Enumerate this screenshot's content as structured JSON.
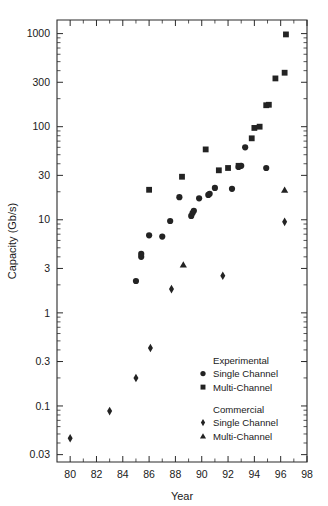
{
  "chart_data": {
    "type": "scatter",
    "title": "",
    "xlabel": "Year",
    "ylabel": "Capacity (Gb/s)",
    "xlim": [
      79,
      98
    ],
    "ylim": [
      0.025,
      1400
    ],
    "yscale": "log",
    "xscale": "linear",
    "grid": false,
    "xticks": [
      80,
      82,
      84,
      86,
      88,
      90,
      92,
      94,
      96,
      98
    ],
    "xtick_labels": [
      "80",
      "82",
      "84",
      "86",
      "88",
      "90",
      "92",
      "94",
      "96",
      "98"
    ],
    "yticks": [
      0.03,
      0.1,
      0.3,
      1,
      3,
      10,
      30,
      100,
      300,
      1000
    ],
    "ytick_labels": [
      "0.03",
      "0.1",
      "0.3",
      "1",
      "3",
      "10",
      "30",
      "100",
      "300",
      "1000"
    ],
    "legend_position": "lower-right",
    "legend_groups": [
      {
        "heading": "Experimental",
        "entries": [
          {
            "label": "Single Channel",
            "marker": "circle"
          },
          {
            "label": "Multi-Channel",
            "marker": "square"
          }
        ]
      },
      {
        "heading": "Commercial",
        "entries": [
          {
            "label": "Single Channel",
            "marker": "diamond"
          },
          {
            "label": "Multi-Channel",
            "marker": "triangle"
          }
        ]
      }
    ],
    "series": [
      {
        "name": "Experimental Single Channel",
        "marker": "circle",
        "color": "#232323",
        "points": [
          [
            85.0,
            2.2
          ],
          [
            85.4,
            4.0
          ],
          [
            85.4,
            4.3
          ],
          [
            86.0,
            6.8
          ],
          [
            87.0,
            6.6
          ],
          [
            87.6,
            9.7
          ],
          [
            88.3,
            17.5
          ],
          [
            89.2,
            11.0
          ],
          [
            89.3,
            11.8
          ],
          [
            89.4,
            12.5
          ],
          [
            89.8,
            17.0
          ],
          [
            90.5,
            18.5
          ],
          [
            90.6,
            19.0
          ],
          [
            91.0,
            22.0
          ],
          [
            92.3,
            21.5
          ],
          [
            92.8,
            37.0
          ],
          [
            93.0,
            38.0
          ],
          [
            93.3,
            60.0
          ],
          [
            94.9,
            36.0
          ]
        ]
      },
      {
        "name": "Experimental Multi-Channel",
        "marker": "square",
        "color": "#232323",
        "points": [
          [
            86.0,
            21.0
          ],
          [
            88.5,
            29.0
          ],
          [
            90.3,
            57.0
          ],
          [
            91.3,
            34.0
          ],
          [
            92.0,
            36.0
          ],
          [
            92.8,
            38.0
          ],
          [
            93.8,
            75.0
          ],
          [
            94.0,
            97.0
          ],
          [
            94.4,
            100.0
          ],
          [
            94.9,
            170.0
          ],
          [
            95.1,
            172.0
          ],
          [
            95.6,
            330.0
          ],
          [
            96.3,
            380.0
          ],
          [
            96.4,
            980.0
          ]
        ]
      },
      {
        "name": "Commercial Single Channel",
        "marker": "diamond",
        "color": "#232323",
        "points": [
          [
            80.0,
            0.045
          ],
          [
            83.0,
            0.088
          ],
          [
            85.0,
            0.2
          ],
          [
            86.1,
            0.42
          ],
          [
            87.7,
            1.8
          ],
          [
            91.6,
            2.5
          ],
          [
            96.3,
            9.5
          ]
        ]
      },
      {
        "name": "Commercial Multi-Channel",
        "marker": "triangle",
        "color": "#232323",
        "points": [
          [
            88.6,
            3.3
          ],
          [
            96.3,
            21.0
          ]
        ]
      }
    ]
  },
  "colors": {
    "marker": "#232323",
    "axis": "#2b2b2b",
    "background": "#ffffff",
    "text": "#1a1a1a"
  }
}
